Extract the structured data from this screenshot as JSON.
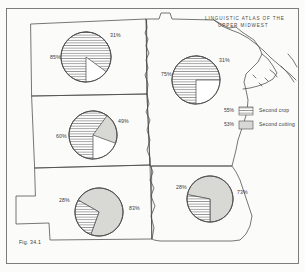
{
  "figure": {
    "caption": "Fig. 34.1",
    "title_lines": [
      "LINGUISTIC ATLAS OF THE",
      "UPPER MIDWEST"
    ]
  },
  "legend": {
    "items": [
      {
        "pct": "55%",
        "label": "Second crop",
        "pattern": "horizontal-hatch",
        "color": "#ffffff"
      },
      {
        "pct": "53%",
        "label": "Second cutting",
        "pattern": "solid-gray",
        "color": "#d8d8d4"
      }
    ]
  },
  "chart_data": {
    "type": "pie",
    "title": "LINGUISTIC ATLAS OF THE UPPER MIDWEST",
    "legend": [
      "Second crop",
      "Second cutting"
    ],
    "legend_position": "right",
    "series": [
      {
        "name": "Second crop",
        "pattern": "horizontal-hatch"
      },
      {
        "name": "Second cutting",
        "pattern": "solid-gray"
      }
    ],
    "pies": [
      {
        "state": "North Dakota",
        "crop_pct": 85,
        "cutting_pct": 31,
        "crop_label": "85%",
        "cutting_label": "31%",
        "cx": 86,
        "cy": 57,
        "r": 25,
        "crop_start": 180,
        "crop_end": 486,
        "cut_start": 0,
        "cut_end": 70,
        "crop_label_x": 50,
        "crop_label_y": 55,
        "cut_label_x": 110,
        "cut_label_y": 33
      },
      {
        "state": "Minnesota",
        "crop_pct": 75,
        "cutting_pct": 31,
        "crop_label": "75%",
        "cutting_label": "31%",
        "cx": 196,
        "cy": 80,
        "r": 24,
        "crop_start": 180,
        "crop_end": 450,
        "cut_start": 0,
        "cut_end": 70,
        "crop_label_x": 161,
        "crop_label_y": 72,
        "cut_label_x": 219,
        "cut_label_y": 58
      },
      {
        "state": "South Dakota",
        "crop_pct": 60,
        "cutting_pct": 49,
        "crop_label": "60%",
        "cutting_label": "49%",
        "cx": 93,
        "cy": 135,
        "r": 24,
        "crop_start": 180,
        "crop_end": 396,
        "cut_start": 0,
        "cut_end": 110,
        "crop_label_x": 56,
        "crop_label_y": 134,
        "cut_label_x": 118,
        "cut_label_y": 119
      },
      {
        "state": "Nebraska",
        "crop_pct": 28,
        "cutting_pct": 83,
        "crop_label": "28%",
        "cutting_label": "83%",
        "cx": 99,
        "cy": 212,
        "r": 24,
        "crop_start": 200,
        "crop_end": 300,
        "cut_start": 300,
        "cut_end": 560,
        "crop_label_x": 59,
        "crop_label_y": 198,
        "cut_label_x": 129,
        "cut_label_y": 206
      },
      {
        "state": "Iowa",
        "crop_pct": 28,
        "cutting_pct": 73,
        "crop_label": "28%",
        "cutting_label": "73%",
        "cx": 210,
        "cy": 199,
        "r": 23,
        "crop_start": 180,
        "crop_end": 281,
        "cut_start": 281,
        "cut_end": 540,
        "crop_label_x": 176,
        "crop_label_y": 185,
        "cut_label_x": 237,
        "cut_label_y": 190
      }
    ]
  }
}
